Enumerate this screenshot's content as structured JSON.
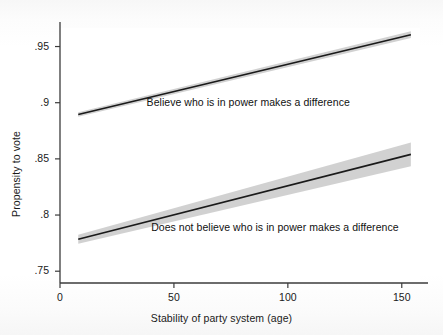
{
  "chart_data": {
    "type": "line",
    "title": "",
    "subtitle": "",
    "xlabel": "Stability of party system (age)",
    "ylabel": "Propensity to vote",
    "xlim": [
      0,
      158
    ],
    "ylim": [
      0.7395,
      0.9665
    ],
    "xticks": [
      0,
      50,
      100,
      150
    ],
    "xticklabels": [
      "0",
      "50",
      "100",
      "150"
    ],
    "yticks": [
      0.75,
      0.8,
      0.85,
      0.9,
      0.95
    ],
    "yticklabels": [
      ".75",
      ".8",
      ".85",
      ".9",
      ".95"
    ],
    "grid": false,
    "legend_position": "inline-annotations",
    "line_color": "#1a1a1a",
    "band_color": "#c9c9c9",
    "series": [
      {
        "name": "Believe who is in power makes a difference",
        "annotation": "Believe who is in power makes a difference",
        "annotation_x": 38,
        "annotation_y": 0.9,
        "x": [
          8,
          154
        ],
        "values": [
          0.8895,
          0.9605
        ],
        "ci_lower": [
          0.8875,
          0.9575
        ],
        "ci_upper": [
          0.8915,
          0.9635
        ]
      },
      {
        "name": "Does not believe who is in power makes a difference",
        "annotation": "Does not believe who is in power makes a difference",
        "annotation_x": 40,
        "annotation_y": 0.7885,
        "x": [
          8,
          154
        ],
        "values": [
          0.7785,
          0.854
        ],
        "ci_lower": [
          0.7745,
          0.8435
        ],
        "ci_upper": [
          0.7825,
          0.8645
        ]
      }
    ]
  },
  "axes": {
    "y_title": "Propensity to vote",
    "x_title": "Stability of party system (age)"
  }
}
